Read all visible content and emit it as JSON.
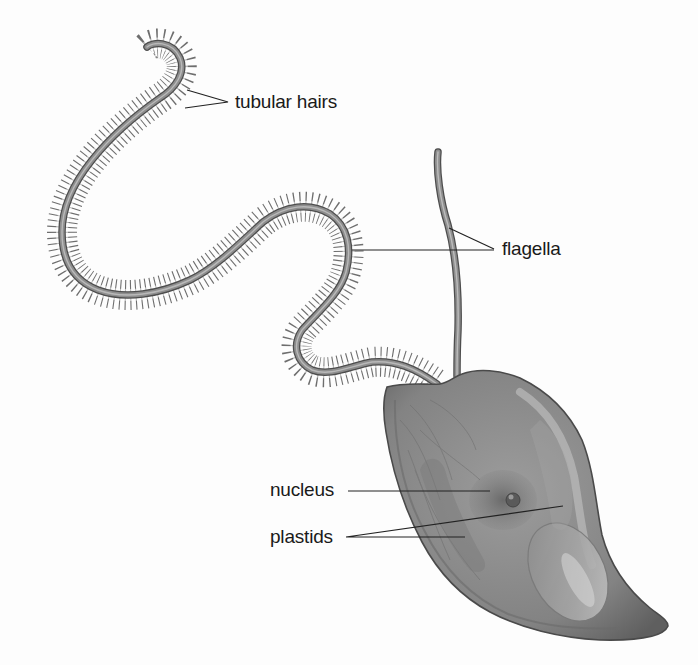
{
  "diagram": {
    "labels": {
      "tubular_hairs": "tubular hairs",
      "flagella": "flagella",
      "nucleus": "nucleus",
      "plastids": "plastids"
    },
    "colors": {
      "background": "#fdfdfd",
      "cell_body": "#8c8c8c",
      "cell_outline": "#4a4a4a",
      "flagellum": "#8a8a8a",
      "flagellum_edge": "#4d4d4d",
      "hairs": "#555555",
      "leader_lines": "#222222",
      "text": "#1a1a1a"
    }
  }
}
